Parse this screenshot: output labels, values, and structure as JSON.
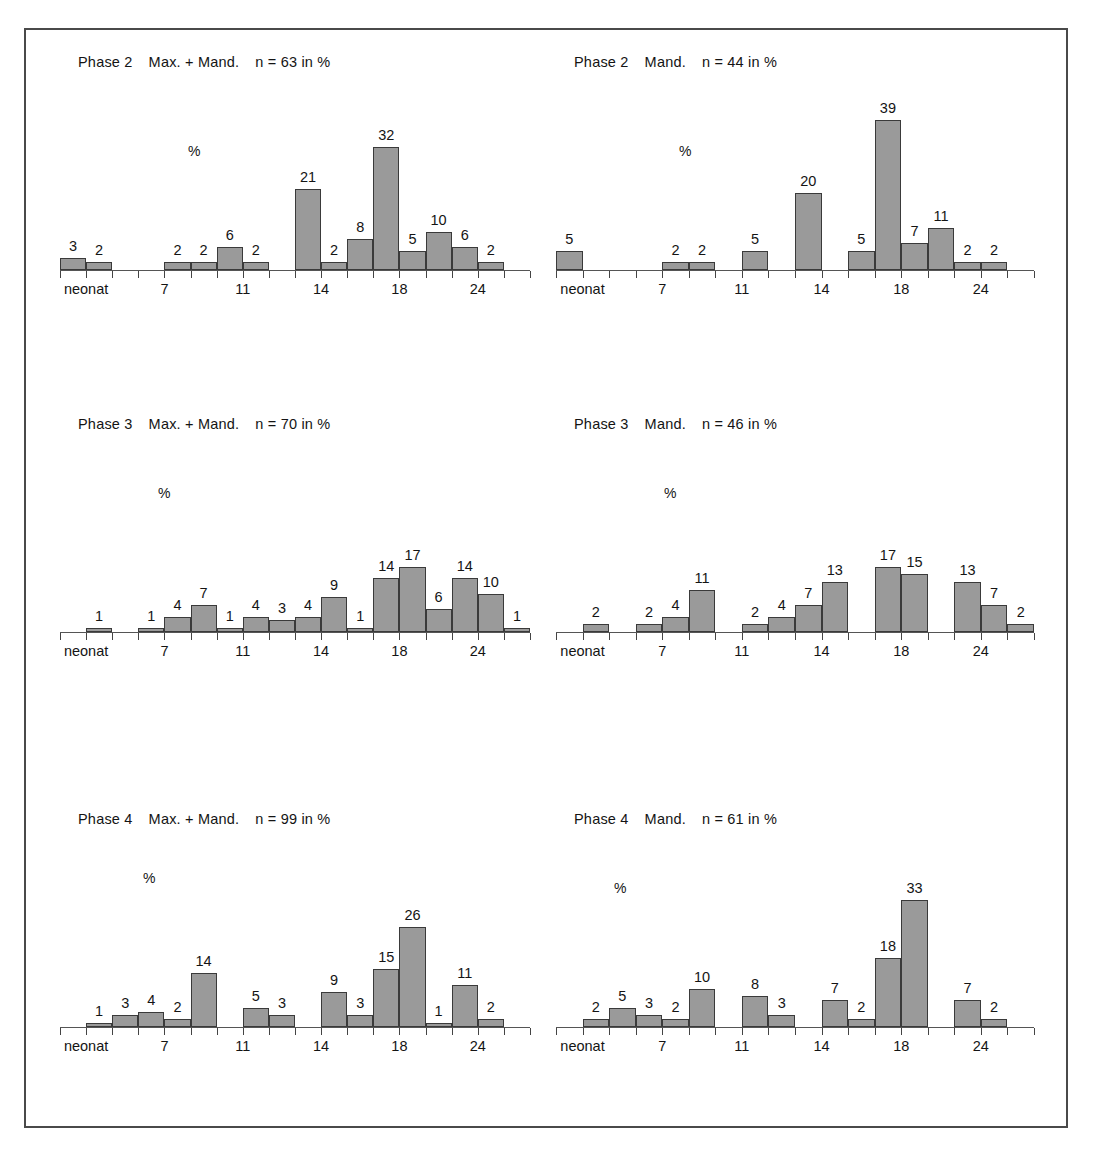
{
  "figure": {
    "frame_color": "#4a4a4a",
    "bar_fill": "#9a9a9a",
    "bar_stroke": "#3a3a3a",
    "axis_color": "#555555",
    "percent_symbol": "%",
    "axis_tick_labels": [
      "neonat",
      "7",
      "11",
      "14",
      "18",
      "24"
    ]
  },
  "chart_data": [
    {
      "id": "phase2-max-mand",
      "type": "bar",
      "title": "Phase 2   Max. + Mand.   n = 63 in %",
      "title_parts": {
        "phase": "Phase 2",
        "group": "Max. + Mand.",
        "n": "n = 63 in %"
      },
      "ylabel": "%",
      "xlabel": "",
      "slots": 18,
      "ylim": [
        0,
        39
      ],
      "grid": false,
      "axis_tick_labels": [
        "neonat",
        "7",
        "11",
        "14",
        "18",
        "24"
      ],
      "axis_tick_slots": [
        1,
        4,
        7,
        10,
        13,
        16
      ],
      "categories": [
        "1",
        "2",
        "3",
        "4",
        "5",
        "6",
        "7",
        "8",
        "9",
        "10",
        "11",
        "12",
        "13",
        "14",
        "15",
        "16",
        "17",
        "18"
      ],
      "values": [
        3,
        2,
        0,
        0,
        2,
        2,
        6,
        2,
        0,
        21,
        2,
        8,
        32,
        5,
        10,
        6,
        2,
        0
      ],
      "bars": [
        {
          "slot": 0,
          "value": 3
        },
        {
          "slot": 1,
          "value": 2
        },
        {
          "slot": 4,
          "value": 2
        },
        {
          "slot": 5,
          "value": 2
        },
        {
          "slot": 6,
          "value": 6
        },
        {
          "slot": 7,
          "value": 2
        },
        {
          "slot": 9,
          "value": 21
        },
        {
          "slot": 10,
          "value": 2
        },
        {
          "slot": 11,
          "value": 8
        },
        {
          "slot": 12,
          "value": 32
        },
        {
          "slot": 13,
          "value": 5
        },
        {
          "slot": 14,
          "value": 10
        },
        {
          "slot": 15,
          "value": 6
        },
        {
          "slot": 16,
          "value": 2
        }
      ]
    },
    {
      "id": "phase2-mand",
      "type": "bar",
      "title": "Phase 2   Mand.  n = 44 in %",
      "title_parts": {
        "phase": "Phase 2",
        "group": "Mand.",
        "n": "n = 44 in %"
      },
      "ylabel": "%",
      "xlabel": "",
      "slots": 18,
      "ylim": [
        0,
        39
      ],
      "grid": false,
      "axis_tick_labels": [
        "neonat",
        "7",
        "11",
        "14",
        "18",
        "24"
      ],
      "axis_tick_slots": [
        1,
        4,
        7,
        10,
        13,
        16
      ],
      "categories": [
        "1",
        "2",
        "3",
        "4",
        "5",
        "6",
        "7",
        "8",
        "9",
        "10",
        "11",
        "12",
        "13",
        "14",
        "15",
        "16",
        "17",
        "18"
      ],
      "values": [
        5,
        0,
        0,
        0,
        2,
        2,
        0,
        5,
        0,
        20,
        0,
        5,
        39,
        7,
        11,
        2,
        2,
        0
      ],
      "bars": [
        {
          "slot": 0,
          "value": 5
        },
        {
          "slot": 4,
          "value": 2
        },
        {
          "slot": 5,
          "value": 2
        },
        {
          "slot": 7,
          "value": 5
        },
        {
          "slot": 9,
          "value": 20
        },
        {
          "slot": 11,
          "value": 5
        },
        {
          "slot": 12,
          "value": 39
        },
        {
          "slot": 13,
          "value": 7
        },
        {
          "slot": 14,
          "value": 11
        },
        {
          "slot": 15,
          "value": 2
        },
        {
          "slot": 16,
          "value": 2
        }
      ]
    },
    {
      "id": "phase3-max-mand",
      "type": "bar",
      "title": "Phase 3   Max. + Mand.  n = 70 in %",
      "title_parts": {
        "phase": "Phase 3",
        "group": "Max. + Mand.",
        "n": "n = 70 in %"
      },
      "ylabel": "%",
      "xlabel": "",
      "slots": 18,
      "ylim": [
        0,
        39
      ],
      "grid": false,
      "axis_tick_labels": [
        "neonat",
        "7",
        "11",
        "14",
        "18",
        "24"
      ],
      "axis_tick_slots": [
        1,
        4,
        7,
        10,
        13,
        16
      ],
      "categories": [
        "1",
        "2",
        "3",
        "4",
        "5",
        "6",
        "7",
        "8",
        "9",
        "10",
        "11",
        "12",
        "13",
        "14",
        "15",
        "16",
        "17",
        "18"
      ],
      "values": [
        0,
        1,
        0,
        1,
        4,
        7,
        1,
        4,
        3,
        4,
        9,
        1,
        14,
        17,
        6,
        14,
        10,
        1
      ],
      "bars": [
        {
          "slot": 1,
          "value": 1
        },
        {
          "slot": 3,
          "value": 1
        },
        {
          "slot": 4,
          "value": 4
        },
        {
          "slot": 5,
          "value": 7
        },
        {
          "slot": 6,
          "value": 1
        },
        {
          "slot": 7,
          "value": 4
        },
        {
          "slot": 8,
          "value": 3
        },
        {
          "slot": 9,
          "value": 4
        },
        {
          "slot": 10,
          "value": 9
        },
        {
          "slot": 11,
          "value": 1
        },
        {
          "slot": 12,
          "value": 14
        },
        {
          "slot": 13,
          "value": 17
        },
        {
          "slot": 14,
          "value": 6
        },
        {
          "slot": 15,
          "value": 14
        },
        {
          "slot": 16,
          "value": 10
        },
        {
          "slot": 17,
          "value": 1
        }
      ]
    },
    {
      "id": "phase3-mand",
      "type": "bar",
      "title": "Phase 3   Mand.   n = 46 in %",
      "title_parts": {
        "phase": "Phase 3",
        "group": "Mand.",
        "n": "n = 46 in %"
      },
      "ylabel": "%",
      "xlabel": "",
      "slots": 18,
      "ylim": [
        0,
        39
      ],
      "grid": false,
      "axis_tick_labels": [
        "neonat",
        "7",
        "11",
        "14",
        "18",
        "24"
      ],
      "axis_tick_slots": [
        1,
        4,
        7,
        10,
        13,
        16
      ],
      "categories": [
        "1",
        "2",
        "3",
        "4",
        "5",
        "6",
        "7",
        "8",
        "9",
        "10",
        "11",
        "12",
        "13",
        "14",
        "15",
        "16",
        "17",
        "18"
      ],
      "values": [
        0,
        2,
        0,
        2,
        4,
        11,
        0,
        2,
        4,
        7,
        13,
        0,
        17,
        15,
        0,
        13,
        7,
        2
      ],
      "bars": [
        {
          "slot": 1,
          "value": 2
        },
        {
          "slot": 3,
          "value": 2
        },
        {
          "slot": 4,
          "value": 4
        },
        {
          "slot": 5,
          "value": 11
        },
        {
          "slot": 7,
          "value": 2
        },
        {
          "slot": 8,
          "value": 4
        },
        {
          "slot": 9,
          "value": 7
        },
        {
          "slot": 10,
          "value": 13
        },
        {
          "slot": 12,
          "value": 17
        },
        {
          "slot": 13,
          "value": 15
        },
        {
          "slot": 15,
          "value": 13
        },
        {
          "slot": 16,
          "value": 7
        },
        {
          "slot": 17,
          "value": 2
        }
      ]
    },
    {
      "id": "phase4-max-mand",
      "type": "bar",
      "title": "Phase 4   Max. + Mand.    n = 99 in %",
      "title_parts": {
        "phase": "Phase 4",
        "group": "Max. + Mand.",
        "n": "n = 99 in %"
      },
      "ylabel": "%",
      "xlabel": "",
      "slots": 18,
      "ylim": [
        0,
        39
      ],
      "grid": false,
      "axis_tick_labels": [
        "neonat",
        "7",
        "11",
        "14",
        "18",
        "24"
      ],
      "axis_tick_slots": [
        1,
        4,
        7,
        10,
        13,
        16
      ],
      "categories": [
        "1",
        "2",
        "3",
        "4",
        "5",
        "6",
        "7",
        "8",
        "9",
        "10",
        "11",
        "12",
        "13",
        "14",
        "15",
        "16",
        "17",
        "18"
      ],
      "values": [
        0,
        1,
        3,
        4,
        2,
        14,
        0,
        5,
        3,
        0,
        9,
        3,
        15,
        26,
        1,
        11,
        2,
        0
      ],
      "bars": [
        {
          "slot": 1,
          "value": 1
        },
        {
          "slot": 2,
          "value": 3
        },
        {
          "slot": 3,
          "value": 4
        },
        {
          "slot": 4,
          "value": 2
        },
        {
          "slot": 5,
          "value": 14
        },
        {
          "slot": 7,
          "value": 5
        },
        {
          "slot": 8,
          "value": 3
        },
        {
          "slot": 10,
          "value": 9
        },
        {
          "slot": 11,
          "value": 3
        },
        {
          "slot": 12,
          "value": 15
        },
        {
          "slot": 13,
          "value": 26
        },
        {
          "slot": 14,
          "value": 1
        },
        {
          "slot": 15,
          "value": 11
        },
        {
          "slot": 16,
          "value": 2
        }
      ]
    },
    {
      "id": "phase4-mand",
      "type": "bar",
      "title": "Phase 4   Mand.   n = 61 in %",
      "title_parts": {
        "phase": "Phase 4",
        "group": "Mand.",
        "n": "n = 61 in %"
      },
      "ylabel": "%",
      "xlabel": "",
      "slots": 18,
      "ylim": [
        0,
        39
      ],
      "grid": false,
      "axis_tick_labels": [
        "neonat",
        "7",
        "11",
        "14",
        "18",
        "24"
      ],
      "axis_tick_slots": [
        1,
        4,
        7,
        10,
        13,
        16
      ],
      "categories": [
        "1",
        "2",
        "3",
        "4",
        "5",
        "6",
        "7",
        "8",
        "9",
        "10",
        "11",
        "12",
        "13",
        "14",
        "15",
        "16",
        "17",
        "18"
      ],
      "values": [
        0,
        2,
        5,
        3,
        2,
        10,
        0,
        8,
        3,
        0,
        7,
        2,
        18,
        33,
        0,
        7,
        2,
        0
      ],
      "bars": [
        {
          "slot": 1,
          "value": 2
        },
        {
          "slot": 2,
          "value": 5
        },
        {
          "slot": 3,
          "value": 3
        },
        {
          "slot": 4,
          "value": 2
        },
        {
          "slot": 5,
          "value": 10
        },
        {
          "slot": 7,
          "value": 8
        },
        {
          "slot": 8,
          "value": 3
        },
        {
          "slot": 10,
          "value": 7
        },
        {
          "slot": 11,
          "value": 2
        },
        {
          "slot": 12,
          "value": 18
        },
        {
          "slot": 13,
          "value": 33
        },
        {
          "slot": 15,
          "value": 7
        },
        {
          "slot": 16,
          "value": 2
        }
      ]
    }
  ]
}
